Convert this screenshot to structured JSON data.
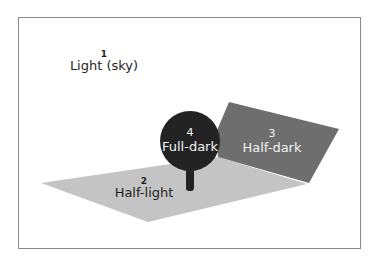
{
  "diagram": {
    "colors": {
      "frame": "#8a8a8a",
      "half_light": "#c4c4c4",
      "half_dark": "#6e6e6e",
      "full_dark": "#232323",
      "background": "#ffffff"
    },
    "zones": [
      {
        "number": "1",
        "label": "Light (sky)"
      },
      {
        "number": "2",
        "label": "Half-light"
      },
      {
        "number": "3",
        "label": "Half-dark"
      },
      {
        "number": "4",
        "label": "Full-dark"
      }
    ]
  }
}
